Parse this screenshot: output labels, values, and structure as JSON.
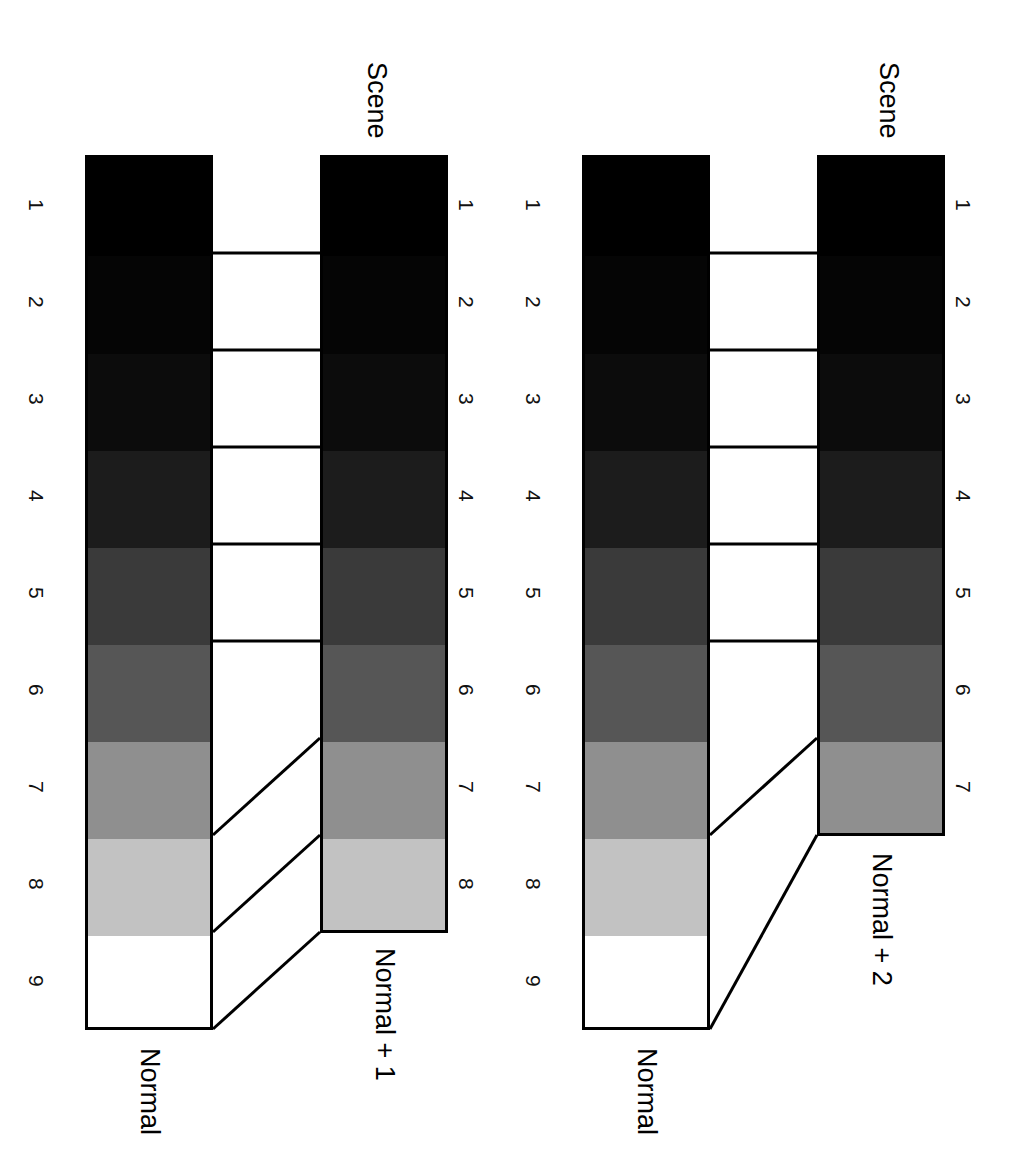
{
  "figure": {
    "type": "diagram",
    "background_color": "#ffffff",
    "line_color": "#000000"
  },
  "zone_grays": {
    "1": "#000000",
    "2": "#050505",
    "3": "#0c0c0c",
    "4": "#1c1c1c",
    "5": "#3a3a3a",
    "6": "#565656",
    "7": "#8f8f8f",
    "8": "#c2c2c2",
    "9": "#ffffff"
  },
  "panels": [
    {
      "id": "panel-normal-plus-1",
      "scene_label": "Scene",
      "reference": {
        "id": "wedge-normal-left",
        "caption": "Normal",
        "zone_labels": [
          "1",
          "2",
          "3",
          "4",
          "5",
          "6",
          "7",
          "8",
          "9"
        ],
        "bands": [
          {
            "zone": "1",
            "gray": "#000000"
          },
          {
            "zone": "2",
            "gray": "#050505"
          },
          {
            "zone": "3",
            "gray": "#0c0c0c"
          },
          {
            "zone": "4",
            "gray": "#1c1c1c"
          },
          {
            "zone": "5",
            "gray": "#3a3a3a"
          },
          {
            "zone": "6",
            "gray": "#565656"
          },
          {
            "zone": "7",
            "gray": "#8f8f8f"
          },
          {
            "zone": "8",
            "gray": "#c2c2c2"
          },
          {
            "zone": "9",
            "gray": "#ffffff"
          }
        ]
      },
      "result": {
        "id": "wedge-normal-plus-1",
        "caption": "Normal + 1",
        "zone_labels": [
          "1",
          "2",
          "3",
          "4",
          "5",
          "6",
          "7",
          "8"
        ],
        "bands": [
          {
            "zone": "1",
            "gray": "#000000"
          },
          {
            "zone": "2",
            "gray": "#050505"
          },
          {
            "zone": "3",
            "gray": "#0c0c0c"
          },
          {
            "zone": "4",
            "gray": "#1c1c1c"
          },
          {
            "zone": "5",
            "gray": "#3a3a3a"
          },
          {
            "zone": "6",
            "gray": "#565656"
          },
          {
            "zone": "7",
            "gray": "#8f8f8f"
          },
          {
            "zone": "8",
            "gray": "#c2c2c2"
          }
        ]
      },
      "mapping_note": "Scene zones 1-5 map straight across; zones 6, 7 and 8 of the result draw from scene zones 7, 8 and 9"
    },
    {
      "id": "panel-normal-plus-2",
      "scene_label": "Scene",
      "reference": {
        "id": "wedge-normal-right",
        "caption": "Normal",
        "zone_labels": [
          "1",
          "2",
          "3",
          "4",
          "5",
          "6",
          "7",
          "8",
          "9"
        ],
        "bands": [
          {
            "zone": "1",
            "gray": "#000000"
          },
          {
            "zone": "2",
            "gray": "#050505"
          },
          {
            "zone": "3",
            "gray": "#0c0c0c"
          },
          {
            "zone": "4",
            "gray": "#1c1c1c"
          },
          {
            "zone": "5",
            "gray": "#3a3a3a"
          },
          {
            "zone": "6",
            "gray": "#565656"
          },
          {
            "zone": "7",
            "gray": "#8f8f8f"
          },
          {
            "zone": "8",
            "gray": "#c2c2c2"
          },
          {
            "zone": "9",
            "gray": "#ffffff"
          }
        ]
      },
      "result": {
        "id": "wedge-normal-plus-2",
        "caption": "Normal + 2",
        "zone_labels": [
          "1",
          "2",
          "3",
          "4",
          "5",
          "6",
          "7"
        ],
        "bands": [
          {
            "zone": "1",
            "gray": "#000000"
          },
          {
            "zone": "2",
            "gray": "#050505"
          },
          {
            "zone": "3",
            "gray": "#0c0c0c"
          },
          {
            "zone": "4",
            "gray": "#1c1c1c"
          },
          {
            "zone": "5",
            "gray": "#3a3a3a"
          },
          {
            "zone": "6",
            "gray": "#565656"
          },
          {
            "zone": "7",
            "gray": "#8f8f8f"
          }
        ]
      },
      "mapping_note": "Scene zones 1-5 map straight across; zones 6 and 7 of the result draw from scene zones 7 and 9"
    }
  ]
}
